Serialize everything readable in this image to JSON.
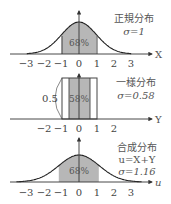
{
  "chart_data": [
    {
      "type": "area",
      "title": "正規分布",
      "sigma_label": "σ=1",
      "xlabel": "X",
      "tick_labels": [
        "−3",
        "−2",
        "−1",
        "0",
        "1",
        "2",
        "3"
      ],
      "ticks": [
        -3,
        -2,
        -1,
        0,
        1,
        2,
        3
      ],
      "distribution": "normal",
      "sigma": 1,
      "shaded_range": [
        -1,
        1
      ],
      "shaded_label": "68%",
      "xlim": [
        -3.3,
        3.3
      ]
    },
    {
      "type": "area",
      "title": "一様分布",
      "sigma_label": "σ=0.58",
      "xlabel": "Y",
      "tick_labels": [
        "−2",
        "−1",
        "0",
        "1",
        "2"
      ],
      "ticks": [
        -2,
        -1,
        0,
        1,
        2
      ],
      "distribution": "uniform",
      "range": [
        -1,
        1
      ],
      "density": 0.5,
      "density_label": "0.5",
      "sigma": 0.58,
      "shaded_range": [
        -0.58,
        0.58
      ],
      "shaded_label": "58%"
    },
    {
      "type": "area",
      "title": "合成分布",
      "formula": "u=X+Y",
      "sigma_label": "σ=1.16",
      "xlabel": "u",
      "tick_labels": [
        "−3",
        "−2",
        "−1",
        "0",
        "1",
        "2",
        "3"
      ],
      "ticks": [
        -3,
        -2,
        -1,
        0,
        1,
        2,
        3
      ],
      "distribution": "normal",
      "sigma": 1.16,
      "shaded_range": [
        -1.16,
        1.16
      ],
      "shaded_label": "68%"
    }
  ],
  "panels": {
    "p1": {
      "title": "正規分布",
      "sigma": "σ=1",
      "axis": "X",
      "pct": "68%",
      "ticks": [
        "−3",
        "−2",
        "−1",
        "0",
        "1",
        "2",
        "3"
      ]
    },
    "p2": {
      "title": "一様分布",
      "sigma": "σ=0.58",
      "axis": "Y",
      "pct": "58%",
      "density": "0.5",
      "ticks": [
        "−2",
        "−1",
        "0",
        "1",
        "2"
      ]
    },
    "p3": {
      "title": "合成分布",
      "formula": "u=X+Y",
      "sigma": "σ=1.16",
      "axis": "u",
      "pct": "68%",
      "ticks": [
        "−3",
        "−2",
        "−1",
        "0",
        "1",
        "2",
        "3"
      ]
    }
  }
}
